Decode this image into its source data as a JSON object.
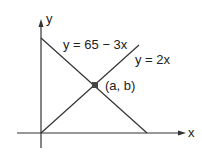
{
  "diagram": {
    "axes": {
      "x_label": "x",
      "y_label": "y"
    },
    "lines": [
      {
        "name": "line-decreasing",
        "equation": "y = 65 − 3x"
      },
      {
        "name": "line-increasing",
        "equation": "y = 2x"
      }
    ],
    "intersection": {
      "label": "(a, b)"
    },
    "colors": {
      "stroke": "#333333",
      "point": "#444444",
      "background": "#ffffff"
    }
  }
}
